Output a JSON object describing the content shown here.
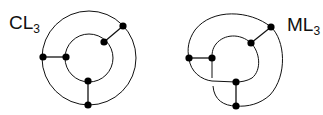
{
  "diagrams": [
    {
      "id": "cl3",
      "label": "CL",
      "subscript": "3",
      "outer_circle": {
        "cx": 89,
        "cy": 58,
        "r": 47
      },
      "inner_circle": {
        "cx": 89,
        "cy": 58,
        "r": 24
      },
      "nodes": [
        [
          123,
          26
        ],
        [
          104,
          42
        ],
        [
          43,
          57
        ],
        [
          66,
          57
        ],
        [
          88,
          81
        ],
        [
          88,
          105
        ]
      ],
      "edges": [
        [
          0,
          1
        ],
        [
          2,
          3
        ],
        [
          4,
          5
        ]
      ]
    },
    {
      "id": "ml3",
      "label": "ML",
      "subscript": "3",
      "nodes": [
        [
          271,
          27
        ],
        [
          251,
          43
        ],
        [
          189,
          58
        ],
        [
          212,
          58
        ],
        [
          236,
          82
        ],
        [
          236,
          106
        ]
      ],
      "edges": [
        [
          0,
          1
        ],
        [
          2,
          3
        ],
        [
          4,
          5
        ]
      ]
    }
  ],
  "colors": {
    "stroke": "#111111",
    "node": "#000000",
    "background": "#ffffff"
  }
}
